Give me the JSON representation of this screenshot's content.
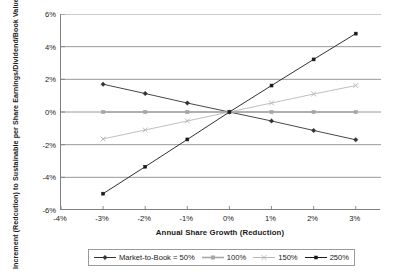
{
  "chart_data": {
    "type": "line",
    "title": "",
    "xlabel": "Annual Share Growth (Reduction)",
    "ylabel": "Increment (Redcution) to Sustainable per Share Earnings/Dividend/Book Value Growth Rate",
    "x": [
      -3,
      -2,
      -1,
      0,
      1,
      2,
      3
    ],
    "xtick_labels": [
      "-4%",
      "-3%",
      "-2%",
      "-1%",
      "0%",
      "1%",
      "2%",
      "3%"
    ],
    "xtick_values": [
      -4,
      -3,
      -2,
      -1,
      0,
      1,
      2,
      3
    ],
    "ytick_labels": [
      "6%",
      "4%",
      "2%",
      "0%",
      "-2%",
      "-4%",
      "-6%"
    ],
    "ytick_values": [
      6,
      4,
      2,
      0,
      -2,
      -4,
      -6
    ],
    "xlim": [
      -4,
      3.6
    ],
    "ylim": [
      -6,
      6
    ],
    "grid": "horizontal",
    "legend_position": "bottom",
    "series": [
      {
        "name": "Market-to-Book = 50%",
        "marker": "diamond",
        "color": "#333333",
        "values": [
          1.7,
          1.13,
          0.55,
          0.0,
          -0.55,
          -1.13,
          -1.7
        ]
      },
      {
        "name": "100%",
        "marker": "square",
        "color": "#a6a6a6",
        "values": [
          0.0,
          0.0,
          0.0,
          0.0,
          0.0,
          0.0,
          0.0
        ]
      },
      {
        "name": "150%",
        "marker": "cross",
        "color": "#b8b8b8",
        "values": [
          -1.65,
          -1.1,
          -0.55,
          0.0,
          0.55,
          1.1,
          1.62
        ]
      },
      {
        "name": "250%",
        "marker": "square-filled",
        "color": "#1a1a1a",
        "values": [
          -5.0,
          -3.35,
          -1.68,
          0.0,
          1.62,
          3.22,
          4.8
        ]
      }
    ]
  },
  "legend": {
    "entries": [
      {
        "label": "Market-to-Book = 50%"
      },
      {
        "label": "100%"
      },
      {
        "label": "150%"
      },
      {
        "label": "250%"
      }
    ]
  }
}
